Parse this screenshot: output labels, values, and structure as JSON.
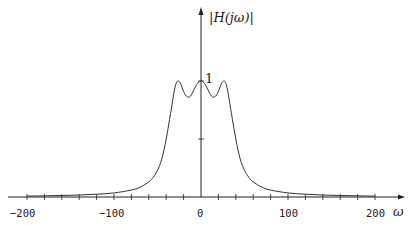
{
  "chart_data": {
    "type": "line",
    "title": "",
    "xlabel": "ω",
    "ylabel": "|H(jω)|",
    "xlim": [
      -220,
      225
    ],
    "ylim": [
      0,
      1.6
    ],
    "x_ticks": [
      -200,
      -100,
      0,
      100,
      200
    ],
    "x_minor_tick_step": 20,
    "y_ticks": [
      0.5,
      1
    ],
    "y_tick_labels_shown": [
      "1"
    ],
    "grid": false,
    "legend": null,
    "series": [
      {
        "name": "|H(jω)|",
        "x": [
          -200,
          -180,
          -160,
          -140,
          -120,
          -100,
          -80,
          -70,
          -60,
          -55,
          -50,
          -45,
          -40,
          -35,
          -32,
          -30,
          -28,
          -26,
          -24,
          -22,
          -20,
          -18,
          -16,
          -14,
          -12,
          -10,
          -8,
          -6,
          -4,
          -2,
          0,
          2,
          4,
          6,
          8,
          10,
          12,
          14,
          16,
          18,
          20,
          22,
          24,
          26,
          28,
          30,
          32,
          35,
          40,
          45,
          50,
          55,
          60,
          70,
          80,
          100,
          120,
          140,
          160,
          180,
          200
        ],
        "values": [
          0.008,
          0.01,
          0.013,
          0.017,
          0.024,
          0.035,
          0.06,
          0.085,
          0.13,
          0.17,
          0.23,
          0.33,
          0.5,
          0.72,
          0.86,
          0.94,
          0.99,
          1.0,
          0.985,
          0.95,
          0.91,
          0.88,
          0.865,
          0.86,
          0.87,
          0.895,
          0.925,
          0.955,
          0.98,
          0.995,
          1.0,
          0.995,
          0.98,
          0.955,
          0.925,
          0.895,
          0.87,
          0.86,
          0.865,
          0.88,
          0.91,
          0.95,
          0.985,
          1.0,
          0.99,
          0.94,
          0.86,
          0.72,
          0.5,
          0.33,
          0.23,
          0.17,
          0.13,
          0.085,
          0.06,
          0.035,
          0.024,
          0.017,
          0.013,
          0.01,
          0.008
        ]
      }
    ]
  },
  "labels": {
    "ylabel": "|H(jω)|",
    "one": "1",
    "omega": "ω",
    "x_ticks": [
      "−200",
      "−100",
      "0",
      "100",
      "200"
    ]
  },
  "colors": {
    "axis": "#222222",
    "curve": "#333333",
    "background": "#ffffff"
  }
}
